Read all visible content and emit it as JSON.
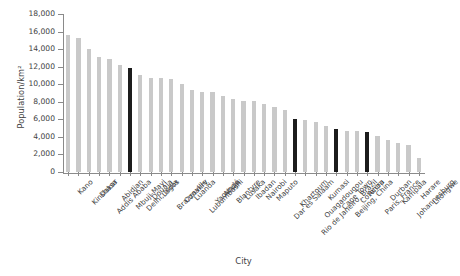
{
  "chart_data": {
    "type": "bar",
    "title": "",
    "xlabel": "City",
    "ylabel": "Population/km²",
    "ylim": [
      0,
      18000
    ],
    "ytick_values": [
      0,
      2000,
      4000,
      6000,
      8000,
      10000,
      12000,
      14000,
      16000,
      18000
    ],
    "ytick_labels": [
      "0",
      "2,000",
      "4,000",
      "6,000",
      "8,000",
      "10,000",
      "12,000",
      "14,000",
      "16,000",
      "18,000"
    ],
    "grid": false,
    "legend": "none",
    "colors": {
      "bar_default": "#c9c9c9",
      "bar_highlight": "#1c1c1c",
      "axis": "#8a8a8a",
      "text": "#3f3f3f",
      "background": "#ffffff"
    },
    "categories": [
      "Kano",
      "Kinshasa",
      "Dakar",
      "Addis Ababa",
      "Abidjan",
      "Mbuji-Mayi",
      "Delhi, India",
      "Douala",
      "Lagos",
      "Brazzaville",
      "Conakry",
      "Luanda",
      "Lubumbashi",
      "Yaoundé",
      "Abuja",
      "Blantyre",
      "Lusaka",
      "Ibadan",
      "Nairobi",
      "Maputo",
      "Dar es Salaam",
      "Khartoum",
      "Rio de Janeiro, Brazil",
      "Ouagadougou",
      "Kumasi",
      "Cape Town",
      "Beijing, China",
      "Cotonou",
      "Accra",
      "Paris, France",
      "Durban",
      "Kampala",
      "Johannesburg",
      "Harare",
      "Lilongwe"
    ],
    "values": [
      15600,
      15300,
      14050,
      13100,
      12900,
      12150,
      11800,
      11000,
      10700,
      10700,
      10600,
      10050,
      9300,
      9100,
      9100,
      8700,
      8350,
      8100,
      8100,
      7700,
      7450,
      7100,
      6000,
      5900,
      5700,
      5200,
      4900,
      4700,
      4700,
      4600,
      4050,
      3600,
      3350,
      3050,
      1650
    ],
    "highlighted": [
      "Delhi, India",
      "Rio de Janeiro, Brazil",
      "Beijing, China",
      "Paris, France"
    ]
  }
}
